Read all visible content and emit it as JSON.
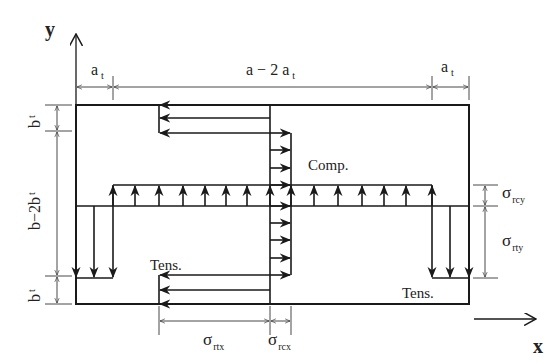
{
  "axes": {
    "y_label": "y",
    "x_label": "x"
  },
  "dimensions": {
    "top": [
      {
        "base": "a",
        "sub": "t",
        "id": "at-left"
      },
      {
        "base": "a − 2 a",
        "sub": "t",
        "id": "a-minus-2at"
      },
      {
        "base": "a",
        "sub": "t",
        "id": "at-right"
      }
    ],
    "left": [
      {
        "base": "b",
        "sub": "t",
        "id": "bt-top"
      },
      {
        "base": "b−2b",
        "sub": "t",
        "id": "b-minus-2bt"
      },
      {
        "base": "b",
        "sub": "t",
        "id": "bt-bottom"
      }
    ],
    "right": [
      {
        "base": "σ",
        "sub": "rcy",
        "id": "sigma-rcy"
      },
      {
        "base": "σ",
        "sub": "rty",
        "id": "sigma-rty"
      }
    ],
    "bottom": [
      {
        "base": "σ",
        "sub": "rtx",
        "id": "sigma-rtx"
      },
      {
        "base": "σ",
        "sub": "rcx",
        "id": "sigma-rcx"
      }
    ]
  },
  "zones": {
    "compression": "Comp.",
    "tension_left": "Tens.",
    "tension_right": "Tens."
  },
  "colors": {
    "line": "#1a1a1a",
    "thin": "#333333",
    "background": "#ffffff"
  }
}
